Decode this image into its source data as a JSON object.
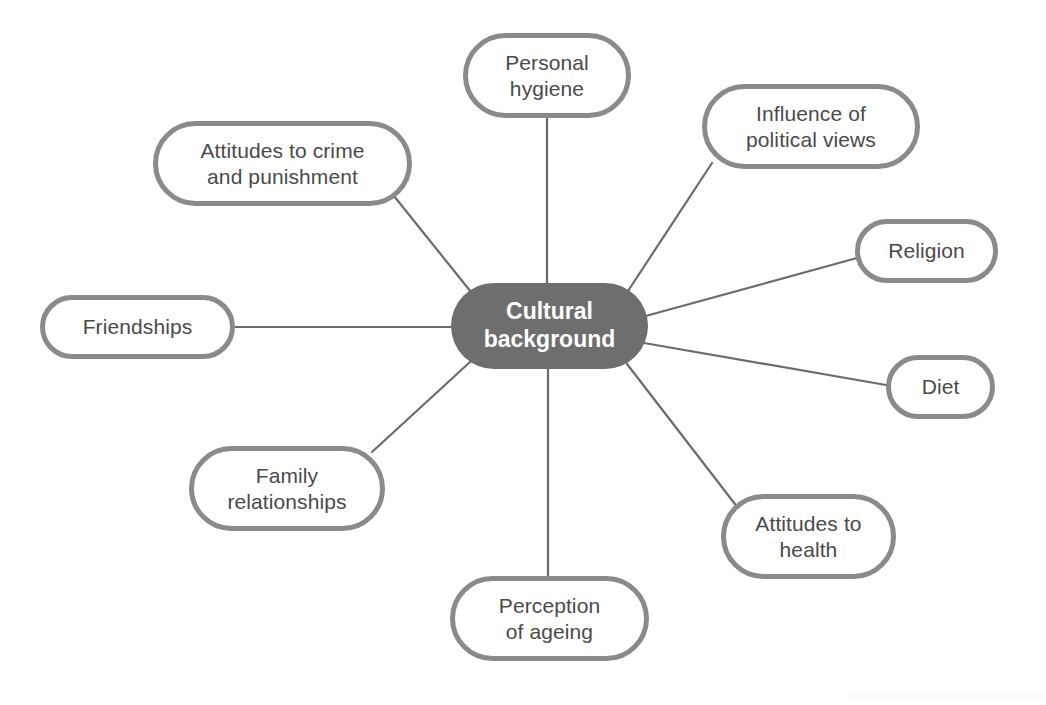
{
  "diagram": {
    "type": "mind-map",
    "canvas": {
      "width": 1046,
      "height": 705
    },
    "colors": {
      "center_fill": "#6e6e6e",
      "center_text": "#ffffff",
      "node_fill": "#ffffff",
      "node_border": "#8a8a8a",
      "node_text": "#4a4a4a",
      "connector": "#6b6b6b",
      "background": "#ffffff"
    },
    "center": {
      "label": "Cultural\nbackground",
      "x": 451,
      "y": 283,
      "width": 197,
      "height": 86
    },
    "nodes": [
      {
        "id": "personal-hygiene",
        "label": "Personal\nhygiene",
        "x": 463,
        "y": 33,
        "width": 168,
        "height": 85,
        "line": {
          "x1": 547,
          "y1": 118,
          "x2": 547,
          "y2": 283
        }
      },
      {
        "id": "influence-political-views",
        "label": "Influence of\npolitical views",
        "x": 702,
        "y": 84,
        "width": 218,
        "height": 85,
        "line": {
          "x1": 712,
          "y1": 163,
          "x2": 628,
          "y2": 291
        }
      },
      {
        "id": "religion",
        "label": "Religion",
        "x": 855,
        "y": 219,
        "width": 143,
        "height": 64,
        "line": {
          "x1": 857,
          "y1": 258,
          "x2": 642,
          "y2": 317
        }
      },
      {
        "id": "diet",
        "label": "Diet",
        "x": 886,
        "y": 355,
        "width": 109,
        "height": 64,
        "line": {
          "x1": 886,
          "y1": 385,
          "x2": 644,
          "y2": 343
        }
      },
      {
        "id": "attitudes-to-health",
        "label": "Attitudes to\nhealth",
        "x": 721,
        "y": 494,
        "width": 175,
        "height": 85,
        "line": {
          "x1": 738,
          "y1": 508,
          "x2": 627,
          "y2": 364
        }
      },
      {
        "id": "perception-of-ageing",
        "label": "Perception\nof ageing",
        "x": 450,
        "y": 576,
        "width": 199,
        "height": 85,
        "line": {
          "x1": 548,
          "y1": 576,
          "x2": 548,
          "y2": 369
        }
      },
      {
        "id": "family-relationships",
        "label": "Family\nrelationships",
        "x": 189,
        "y": 446,
        "width": 196,
        "height": 85,
        "line": {
          "x1": 372,
          "y1": 452,
          "x2": 470,
          "y2": 362
        }
      },
      {
        "id": "friendships",
        "label": "Friendships",
        "x": 40,
        "y": 295,
        "width": 195,
        "height": 64,
        "line": {
          "x1": 235,
          "y1": 327,
          "x2": 452,
          "y2": 327
        }
      },
      {
        "id": "attitudes-to-crime-and-punishment",
        "label": "Attitudes to crime\nand punishment",
        "x": 153,
        "y": 121,
        "width": 259,
        "height": 85,
        "line": {
          "x1": 394,
          "y1": 196,
          "x2": 471,
          "y2": 292
        }
      }
    ]
  }
}
